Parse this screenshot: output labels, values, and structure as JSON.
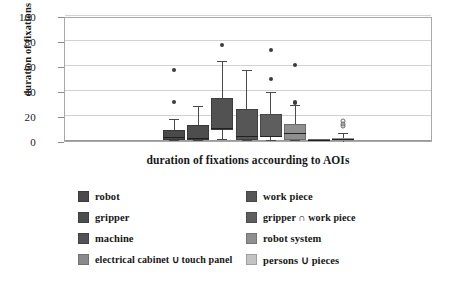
{
  "chart_data": {
    "type": "box",
    "title": "",
    "xlabel": "duration of fixations accourding to AOIs",
    "ylabel": "duration of fixations [%]",
    "ylim": [
      0,
      100
    ],
    "yticks": [
      0,
      20,
      40,
      60,
      80,
      100
    ],
    "grid": true,
    "legend_position": "bottom",
    "categories": [
      "robot",
      "gripper",
      "machine",
      "electrical cabinet ∪ touch panel",
      "work piece",
      "gripper ∩ work piece",
      "robot system",
      "persons ∪ pieces"
    ],
    "series": [
      {
        "name": "robot",
        "color": "#4a4a4a",
        "whisker_low": 0,
        "q1": 0.5,
        "median": 2.5,
        "q3": 9,
        "whisker_high": 17,
        "outliers": [
          31,
          57
        ]
      },
      {
        "name": "gripper",
        "color": "#4d4d4d",
        "whisker_low": 0,
        "q1": 0.5,
        "median": 2,
        "q3": 13,
        "whisker_high": 27,
        "outliers": []
      },
      {
        "name": "machine",
        "color": "#525252",
        "whisker_low": 1,
        "q1": 9,
        "median": 9.5,
        "q3": 34.5,
        "whisker_high": 63,
        "outliers": [
          76.5
        ]
      },
      {
        "name": "electrical cabinet ∪ touch panel",
        "color": "#8a8a8a",
        "whisker_low": 0,
        "q1": 0,
        "median": 0.3,
        "q3": 0.6,
        "whisker_high": 1,
        "outliers": []
      },
      {
        "name": "work piece",
        "color": "#565656",
        "whisker_low": 0,
        "q1": 0.5,
        "median": 3,
        "q3": 26,
        "whisker_high": 56,
        "outliers": []
      },
      {
        "name": "gripper ∩ work piece",
        "color": "#5e5e5e",
        "whisker_low": 0,
        "q1": 3,
        "median": 3.5,
        "q3": 21.5,
        "whisker_high": 38.5,
        "outliers": [
          50,
          73
        ]
      },
      {
        "name": "robot system",
        "color": "#8f8f8f",
        "whisker_low": 0,
        "q1": 0.5,
        "median": 6,
        "q3": 14,
        "whisker_high": 28,
        "outliers": [
          30.5,
          31.5,
          61
        ]
      },
      {
        "name": "persons ∪ pieces",
        "color": "#c3c3c3",
        "whisker_low": 0,
        "q1": 0.4,
        "median": 1.2,
        "q3": 2.8,
        "whisker_high": 6,
        "outliers": [
          12,
          14,
          16
        ]
      }
    ]
  },
  "axes": {
    "ytick_labels": [
      "100",
      "80",
      "60",
      "40",
      "20",
      "0"
    ],
    "ylabel": "duration of fixations [%]",
    "xlabel": "duration of fixations accourding to AOIs"
  },
  "legend": {
    "entries": [
      {
        "label": "robot",
        "color": "#4a4a4a"
      },
      {
        "label": "work piece",
        "color": "#565656"
      },
      {
        "label": "gripper",
        "color": "#4d4d4d"
      },
      {
        "label": "gripper ∩ work piece",
        "color": "#5e5e5e"
      },
      {
        "label": "machine",
        "color": "#525252"
      },
      {
        "label": "robot system",
        "color": "#8f8f8f"
      },
      {
        "label": "electrical cabinet ∪ touch panel",
        "color": "#8a8a8a"
      },
      {
        "label": "persons ∪ pieces",
        "color": "#c3c3c3"
      }
    ]
  }
}
